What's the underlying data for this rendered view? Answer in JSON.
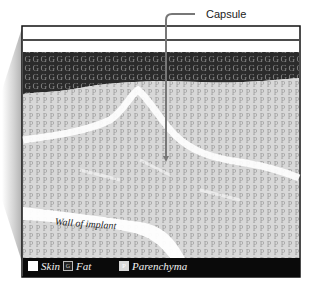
{
  "diagram": {
    "callout": {
      "label": "Capsule"
    },
    "annotations": {
      "wall": "Wall of implant"
    },
    "layers": [
      {
        "name": "Skin",
        "fill": "#ffffff"
      },
      {
        "name": "Fat",
        "glyph": "G",
        "fill": "#2b2b2b"
      },
      {
        "name": "Parenchyma",
        "glyph": "P",
        "fill": "#d8d8d8"
      }
    ],
    "legend": [
      {
        "label": "Skin",
        "glyph": ""
      },
      {
        "label": "Fat",
        "glyph": "G"
      },
      {
        "label": "Parenchyma",
        "glyph": "P"
      }
    ],
    "colors": {
      "frame": "#111111",
      "fat": "#2b2b2b",
      "parenchyma": "#d8d8d8",
      "capsule_line": "#777777",
      "shadow": "#bdbdbd"
    }
  }
}
